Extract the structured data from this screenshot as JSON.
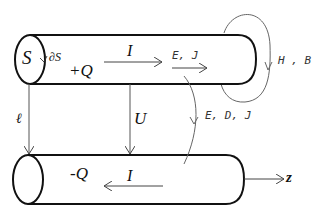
{
  "diagram": {
    "top_conductor": {
      "cross_section_label": "S",
      "boundary_label": "∂S",
      "charge_label": "+Q",
      "current_label": "I",
      "field_label": "E, J"
    },
    "bottom_conductor": {
      "charge_label": "-Q",
      "current_label": "I"
    },
    "length_label": "ℓ",
    "voltage_label": "U",
    "magnetic_field_label": "H , B",
    "electric_field_label": "E, D, J",
    "axis_label": "z",
    "colors": {
      "stroke": "#111111",
      "thin_stroke": "#555555",
      "background": "#ffffff"
    }
  }
}
